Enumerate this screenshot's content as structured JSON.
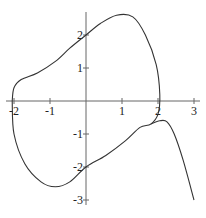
{
  "chart_data": {
    "type": "line",
    "title": "",
    "xlabel": "",
    "ylabel": "",
    "xlim": [
      -2.1,
      3.1
    ],
    "ylim": [
      -3.1,
      2.7
    ],
    "grid": false,
    "legend": null,
    "x_ticks": [
      "-2",
      "-1",
      "1",
      "2",
      "3"
    ],
    "y_ticks": [
      "2",
      "1",
      "-1",
      "-2",
      "-3"
    ],
    "series": [
      {
        "name": "closed loop",
        "x": [
          -2.05,
          -2.0,
          -1.8,
          -1.35,
          -0.85,
          -0.45,
          0.0,
          0.4,
          0.85,
          1.3,
          1.65,
          1.95,
          2.05,
          2.0,
          1.8,
          1.5,
          1.1,
          0.55,
          0.0,
          -0.45,
          -0.85,
          -1.25,
          -1.7,
          -2.0,
          -2.05
        ],
        "y": [
          0.0,
          0.4,
          0.65,
          0.85,
          1.2,
          1.6,
          2.0,
          2.35,
          2.6,
          2.55,
          2.0,
          1.1,
          0.2,
          -0.4,
          -0.7,
          -0.8,
          -1.2,
          -1.65,
          -2.0,
          -2.45,
          -2.6,
          -2.45,
          -1.9,
          -1.0,
          0.0
        ]
      },
      {
        "name": "right branch",
        "x": [
          1.8,
          2.05,
          2.25,
          2.45,
          2.7,
          3.0
        ],
        "y": [
          -0.7,
          -0.6,
          -0.63,
          -1.0,
          -1.8,
          -3.0
        ]
      }
    ]
  }
}
